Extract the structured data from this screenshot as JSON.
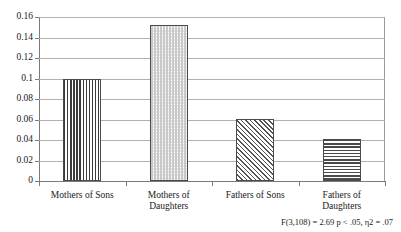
{
  "figure": {
    "title_sliver": "",
    "footnote": "F(3,108) = 2.69 p < .05, η2 = .07"
  },
  "chart_data": {
    "type": "bar",
    "title": "",
    "xlabel": "",
    "ylabel": "",
    "categories": [
      "Mothers of Sons",
      "Mothers of Daughters",
      "Fathers of Sons",
      "Fathers of Daughters"
    ],
    "category_lines": [
      [
        "Mothers of Sons"
      ],
      [
        "Mothers of",
        "Daughters"
      ],
      [
        "Fathers of Sons"
      ],
      [
        "Fathers of",
        "Daughters"
      ]
    ],
    "values": [
      0.1,
      0.152,
      0.061,
      0.041
    ],
    "ylim": [
      0,
      0.16
    ],
    "ytick_values": [
      0,
      0.02,
      0.04,
      0.06,
      0.08,
      0.1,
      0.12,
      0.14,
      0.16
    ],
    "ytick_labels": [
      "0",
      "0.02",
      "0.04",
      "0.06",
      "0.08",
      "0.1",
      "0.12",
      "0.14",
      "0.16"
    ],
    "grid": true,
    "legend": false,
    "bar_patterns": [
      "vertical-stripes",
      "dots",
      "diagonal-hatch",
      "horizontal-stripes"
    ],
    "annotations": [
      "F(3,108) = 2.69 p < .05, η2 = .07"
    ]
  },
  "colors": {
    "background": "#ffffff",
    "axis": "#7a7a7a",
    "gridline": "#b0b0b0",
    "bar_outline": "#4a4a4a",
    "text": "#1a1a1a"
  }
}
